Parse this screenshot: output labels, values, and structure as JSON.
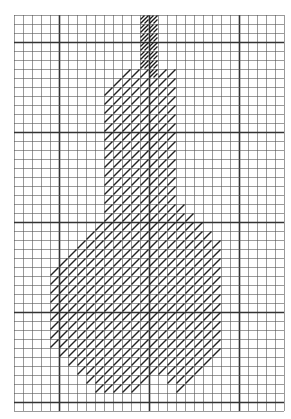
{
  "diagram": {
    "type": "cross-stitch-chart",
    "grid": {
      "origin_x": 14,
      "origin_y": 15,
      "cell": 9,
      "cols": 30,
      "rows": 44,
      "major_every": 10,
      "major_offset_x": 5,
      "major_offset_y": 3,
      "line_color": "#555555",
      "major_color": "#333333"
    },
    "colors": {
      "hatch": "#222222",
      "stem_hatch": "#1a1a1a",
      "background": "#ffffff"
    },
    "stem_rows": [
      {
        "row": 0,
        "start": 14,
        "end": 15
      },
      {
        "row": 1,
        "start": 14,
        "end": 15
      },
      {
        "row": 2,
        "start": 14,
        "end": 15
      },
      {
        "row": 3,
        "start": 14,
        "end": 15
      },
      {
        "row": 4,
        "start": 14,
        "end": 15
      },
      {
        "row": 5,
        "start": 14,
        "end": 15
      },
      {
        "row": 6,
        "start": 15,
        "end": 15
      }
    ],
    "body_rows": [
      {
        "row": 6,
        "start": 12,
        "end": 14
      },
      {
        "row": 6,
        "start": 16,
        "end": 17
      },
      {
        "row": 7,
        "start": 11,
        "end": 17
      },
      {
        "row": 8,
        "start": 10,
        "end": 17
      },
      {
        "row": 9,
        "start": 10,
        "end": 17
      },
      {
        "row": 10,
        "start": 10,
        "end": 17
      },
      {
        "row": 11,
        "start": 10,
        "end": 17
      },
      {
        "row": 12,
        "start": 10,
        "end": 17
      },
      {
        "row": 13,
        "start": 10,
        "end": 17
      },
      {
        "row": 14,
        "start": 10,
        "end": 17
      },
      {
        "row": 15,
        "start": 10,
        "end": 17
      },
      {
        "row": 16,
        "start": 10,
        "end": 17
      },
      {
        "row": 17,
        "start": 10,
        "end": 17
      },
      {
        "row": 18,
        "start": 10,
        "end": 17
      },
      {
        "row": 19,
        "start": 10,
        "end": 17
      },
      {
        "row": 20,
        "start": 10,
        "end": 17
      },
      {
        "row": 21,
        "start": 10,
        "end": 18
      },
      {
        "row": 22,
        "start": 10,
        "end": 19
      },
      {
        "row": 23,
        "start": 9,
        "end": 20
      },
      {
        "row": 24,
        "start": 8,
        "end": 21
      },
      {
        "row": 25,
        "start": 7,
        "end": 22
      },
      {
        "row": 26,
        "start": 6,
        "end": 22
      },
      {
        "row": 27,
        "start": 5,
        "end": 22
      },
      {
        "row": 28,
        "start": 4,
        "end": 22
      },
      {
        "row": 29,
        "start": 4,
        "end": 22
      },
      {
        "row": 30,
        "start": 4,
        "end": 22
      },
      {
        "row": 31,
        "start": 4,
        "end": 22
      },
      {
        "row": 32,
        "start": 4,
        "end": 22
      },
      {
        "row": 33,
        "start": 4,
        "end": 22
      },
      {
        "row": 34,
        "start": 4,
        "end": 22
      },
      {
        "row": 35,
        "start": 4,
        "end": 22
      },
      {
        "row": 36,
        "start": 4,
        "end": 22
      },
      {
        "row": 37,
        "start": 5,
        "end": 22
      },
      {
        "row": 38,
        "start": 6,
        "end": 21
      },
      {
        "row": 39,
        "start": 7,
        "end": 20
      },
      {
        "row": 40,
        "start": 8,
        "end": 14
      },
      {
        "row": 40,
        "start": 17,
        "end": 19
      },
      {
        "row": 41,
        "start": 9,
        "end": 13
      },
      {
        "row": 41,
        "start": 18,
        "end": 18
      }
    ]
  }
}
